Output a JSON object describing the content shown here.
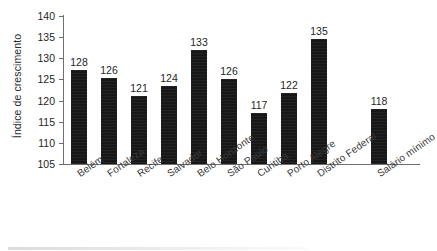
{
  "chart_data": {
    "type": "bar",
    "title": "",
    "xlabel": "",
    "ylabel": "Índice de crescimento",
    "ylim": [
      105,
      140
    ],
    "ytick_step": 5,
    "yticks": [
      140,
      135,
      130,
      125,
      120,
      115,
      110,
      105
    ],
    "grid": false,
    "legend": null,
    "bar_color": "#171717",
    "axis_color": "#6f6f6f",
    "categories": [
      "Belém",
      "Fortaleza",
      "Recife",
      "Salvador",
      "Belo Horizonte",
      "São Paulo",
      "Curitiba",
      "Porto Alegre",
      "Distrito Federal",
      "Salário mínimo"
    ],
    "values": [
      128,
      126,
      121,
      124,
      133,
      126,
      117,
      122,
      135,
      118
    ],
    "bar_tops": [
      127.3,
      125.3,
      121.1,
      123.4,
      132.0,
      125.0,
      117.0,
      121.9,
      134.5,
      118.0
    ],
    "data_labels": [
      "128",
      "126",
      "121",
      "124",
      "133",
      "126",
      "117",
      "122",
      "135",
      "118"
    ]
  }
}
